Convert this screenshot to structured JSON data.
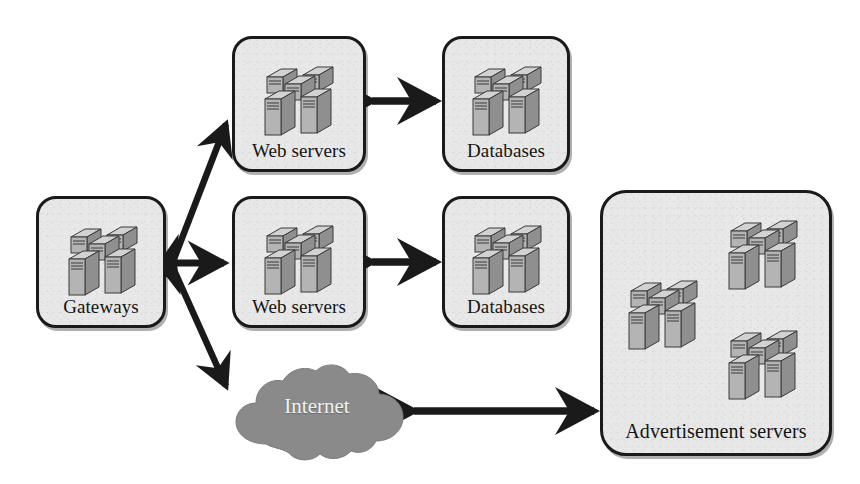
{
  "diagram": {
    "background_color": "#ffffff",
    "box_fill_color": "#e8e8e8",
    "box_border_color": "#1a1a1a",
    "cloud_fill_color": "#8a8a8a",
    "cloud_text_color": "#f2f2f2",
    "arrow_color": "#1a1a1a",
    "server_body_color": "#b4b4b4",
    "server_top_color": "#d2d2d2",
    "server_side_color": "#8f8f8f"
  },
  "nodes": [
    {
      "id": "gateways",
      "label": "Gateways",
      "icon": "server-cluster-icon",
      "server_clusters": 1,
      "x": 36,
      "y": 196,
      "w": 130,
      "h": 132
    },
    {
      "id": "web-servers-top",
      "label": "Web servers",
      "icon": "server-cluster-icon",
      "server_clusters": 1,
      "x": 232,
      "y": 36,
      "w": 134,
      "h": 136
    },
    {
      "id": "web-servers-middle",
      "label": "Web servers",
      "icon": "server-cluster-icon",
      "server_clusters": 1,
      "x": 232,
      "y": 196,
      "w": 134,
      "h": 132
    },
    {
      "id": "databases-top",
      "label": "Databases",
      "icon": "server-cluster-icon",
      "server_clusters": 1,
      "x": 442,
      "y": 36,
      "w": 128,
      "h": 136
    },
    {
      "id": "databases-middle",
      "label": "Databases",
      "icon": "server-cluster-icon",
      "server_clusters": 1,
      "x": 442,
      "y": 196,
      "w": 128,
      "h": 132
    },
    {
      "id": "advertisement-servers",
      "label": "Advertisement servers",
      "icon": "server-cluster-icon",
      "server_clusters": 3,
      "x": 600,
      "y": 190,
      "w": 232,
      "h": 266
    }
  ],
  "cloud": {
    "id": "internet-cloud",
    "label": "Internet",
    "x": 226,
    "y": 362,
    "w": 180,
    "h": 100
  },
  "edges": [
    {
      "id": "gateways-to-web-top",
      "type": "double-arrow",
      "style": "thick-diagonal"
    },
    {
      "id": "gateways-to-web-middle",
      "type": "double-arrow",
      "style": "horizontal"
    },
    {
      "id": "gateways-to-internet",
      "type": "double-arrow",
      "style": "thick-diagonal"
    },
    {
      "id": "web-top-to-databases-top",
      "type": "double-arrow",
      "style": "horizontal"
    },
    {
      "id": "web-middle-to-databases-mid",
      "type": "double-arrow",
      "style": "horizontal"
    },
    {
      "id": "internet-to-advertisement",
      "type": "double-arrow",
      "style": "horizontal"
    }
  ]
}
